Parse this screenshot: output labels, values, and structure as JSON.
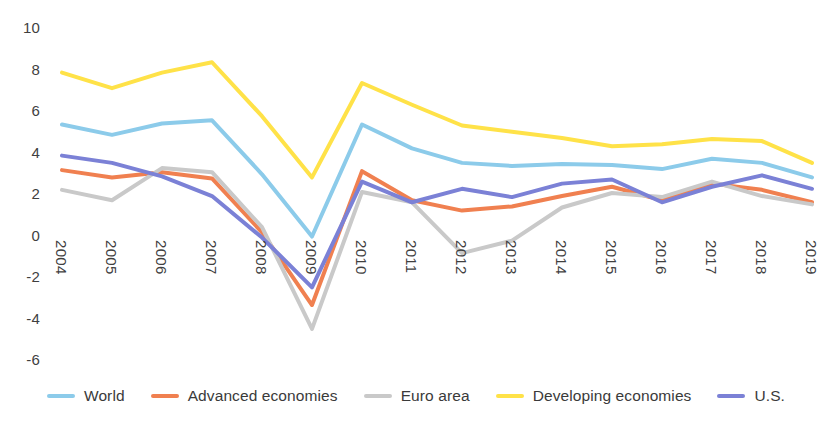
{
  "chart_data": {
    "type": "line",
    "title": "",
    "subtitle": "",
    "xlabel": "",
    "ylabel": "",
    "categories": [
      "2004",
      "2005",
      "2006",
      "2007",
      "2008",
      "2009",
      "2010",
      "2011",
      "2012",
      "2013",
      "2014",
      "2015",
      "2016",
      "2017",
      "2018",
      "2019"
    ],
    "ylim": [
      -6,
      10
    ],
    "yticks": [
      10,
      8,
      6,
      4,
      2,
      0,
      -2,
      -4,
      -6
    ],
    "ytick_labels": [
      "10",
      "8",
      "6",
      "4",
      "2",
      "0",
      "-2",
      "-4",
      "-6"
    ],
    "grid": false,
    "legend_position": "bottom",
    "series": [
      {
        "name": "World",
        "color": "#8CCBEA",
        "values": [
          5.35,
          4.85,
          5.4,
          5.55,
          2.95,
          -0.05,
          5.35,
          4.2,
          3.5,
          3.35,
          3.45,
          3.4,
          3.2,
          3.7,
          3.5,
          2.8
        ]
      },
      {
        "name": "Advanced economies",
        "color": "#F08050",
        "values": [
          3.15,
          2.8,
          3.05,
          2.75,
          0.15,
          -3.35,
          3.1,
          1.7,
          1.2,
          1.4,
          1.9,
          2.35,
          1.7,
          2.5,
          2.2,
          1.6
        ]
      },
      {
        "name": "Euro area",
        "color": "#C9C9C9",
        "values": [
          2.2,
          1.7,
          3.25,
          3.05,
          0.4,
          -4.5,
          2.1,
          1.6,
          -0.85,
          -0.25,
          1.35,
          2.05,
          1.85,
          2.6,
          1.9,
          1.5
        ]
      },
      {
        "name": "Developing economies",
        "color": "#FFE248",
        "values": [
          7.85,
          7.1,
          7.85,
          8.35,
          5.75,
          2.8,
          7.35,
          6.3,
          5.3,
          5.0,
          4.7,
          4.3,
          4.4,
          4.65,
          4.55,
          3.5
        ]
      },
      {
        "name": "U.S.",
        "color": "#7B81D6",
        "values": [
          3.85,
          3.5,
          2.85,
          1.9,
          -0.1,
          -2.5,
          2.6,
          1.6,
          2.25,
          1.85,
          2.5,
          2.7,
          1.6,
          2.35,
          2.9,
          2.25
        ]
      }
    ]
  },
  "legend": {
    "entries": [
      {
        "label": "World",
        "color": "#8CCBEA",
        "icon": "line-swatch-icon"
      },
      {
        "label": "Advanced economies",
        "color": "#F08050",
        "icon": "line-swatch-icon"
      },
      {
        "label": "Euro area",
        "color": "#C9C9C9",
        "icon": "line-swatch-icon"
      },
      {
        "label": "Developing economies",
        "color": "#FFE248",
        "icon": "line-swatch-icon"
      },
      {
        "label": "U.S.",
        "color": "#7B81D6",
        "icon": "line-swatch-icon"
      }
    ]
  }
}
